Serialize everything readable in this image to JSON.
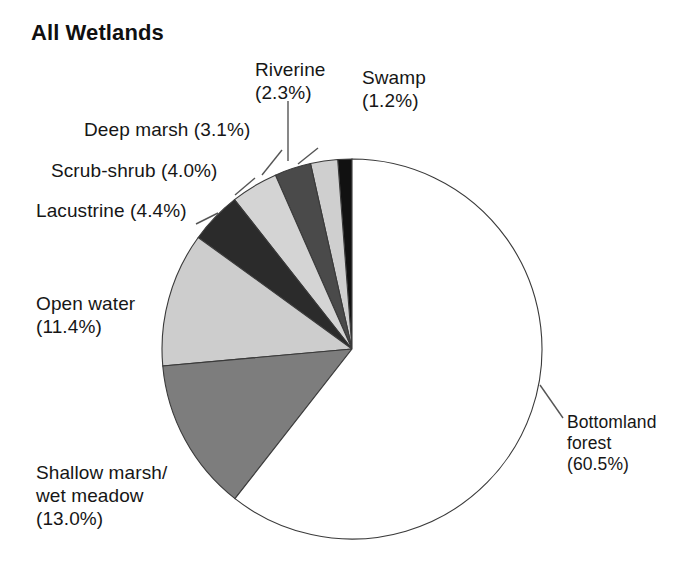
{
  "chart_data": {
    "type": "pie",
    "title": "All Wetlands",
    "xlabel": "",
    "ylabel": "",
    "legend_position": "callout-labels",
    "grid": false,
    "units": "percent",
    "start_angle_deg": 90,
    "direction": "counterclockwise",
    "categories": [
      "Swamp",
      "Riverine",
      "Deep marsh",
      "Scrub-shrub",
      "Lacustrine",
      "Open water",
      "Shallow marsh/wet meadow",
      "Bottomland forest"
    ],
    "values": [
      1.2,
      2.3,
      3.1,
      4.0,
      4.4,
      11.4,
      13.0,
      60.5
    ],
    "slices": [
      {
        "name": "Swamp",
        "value": 1.2,
        "fill": "#111111",
        "label": "Swamp\n(1.2%)"
      },
      {
        "name": "Riverine",
        "value": 2.3,
        "fill": "#cfcfcf",
        "label": "Riverine\n(2.3%)"
      },
      {
        "name": "Deep marsh",
        "value": 3.1,
        "fill": "#4a4a4a",
        "label": "Deep marsh (3.1%)"
      },
      {
        "name": "Scrub-shrub",
        "value": 4.0,
        "fill": "#d4d4d4",
        "label": "Scrub-shrub (4.0%)"
      },
      {
        "name": "Lacustrine",
        "value": 4.4,
        "fill": "#2b2b2b",
        "label": "Lacustrine (4.4%)"
      },
      {
        "name": "Open water",
        "value": 11.4,
        "fill": "#cdcdcd",
        "label": "Open water\n(11.4%)"
      },
      {
        "name": "Shallow marsh/wet meadow",
        "value": 13.0,
        "fill": "#7d7d7d",
        "label": "Shallow marsh/\nwet meadow\n(13.0%)"
      },
      {
        "name": "Bottomland forest",
        "value": 60.5,
        "fill": "#ffffff",
        "label": "Bottomland\n forest\n(60.5%)"
      }
    ],
    "colors": {
      "outline": "#3a3a3a",
      "leader_line": "#555555",
      "text": "#161616",
      "background": "#ffffff"
    }
  },
  "labels": {
    "title": "All Wetlands",
    "riverine": "Riverine\n(2.3%)",
    "swamp": "Swamp\n(1.2%)",
    "deep_marsh": "Deep marsh (3.1%)",
    "scrub_shrub": "Scrub-shrub (4.0%)",
    "lacustrine": "Lacustrine (4.4%)",
    "open_water": "Open water\n(11.4%)",
    "shallow_marsh": "Shallow marsh/\nwet meadow\n(13.0%)",
    "bottomland_forest": "Bottomland\n forest\n(60.5%)"
  }
}
